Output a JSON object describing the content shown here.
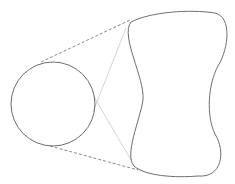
{
  "diagram": {
    "colors": {
      "background": "#ffffff",
      "outline": "#6e6e6e",
      "dashed": "#8a8a8a",
      "guide": "#d4d4d4"
    },
    "circle": {
      "cx": 53,
      "cy": 104,
      "r": 42
    },
    "shape_path": "M 131 22 C 150 12, 190 9, 215 13 C 232 17, 229 48, 218 66 C 208 84, 206 116, 215 134 C 226 152, 222 178, 198 176 C 175 178, 145 176, 134 166 C 124 155, 140 120, 143 100 C 145 78, 120 36, 131 22 Z",
    "dashed_lines": [
      {
        "x1": 41,
        "y1": 62,
        "x2": 130,
        "y2": 20
      },
      {
        "x1": 50,
        "y1": 146,
        "x2": 138,
        "y2": 170
      }
    ],
    "guide_lines": [
      {
        "x1": 126,
        "y1": 28,
        "x2": 93,
        "y2": 112
      },
      {
        "x1": 93,
        "y1": 95,
        "x2": 131,
        "y2": 160
      }
    ]
  }
}
